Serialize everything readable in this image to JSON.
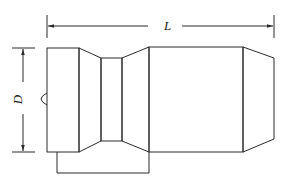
{
  "diagram": {
    "title": "",
    "type": "technical drawing - nozzle/fitting side view",
    "labels": {
      "length": "L",
      "diameter": "D"
    },
    "colors": {
      "stroke": "#2a2a2a",
      "background": "#ffffff"
    },
    "components": [
      {
        "name": "left-cylinder-block",
        "x": [
          47,
          79
        ],
        "y": [
          47,
          152
        ]
      },
      {
        "name": "left-taper",
        "x": [
          79,
          101
        ]
      },
      {
        "name": "neck",
        "x": [
          101,
          122
        ],
        "y": [
          58,
          141
        ]
      },
      {
        "name": "right-taper",
        "x": [
          122,
          149
        ]
      },
      {
        "name": "main-body",
        "x": [
          149,
          243
        ],
        "y": [
          46,
          152
        ]
      },
      {
        "name": "nose-cone",
        "x": [
          243,
          274
        ],
        "y": [
          58,
          139
        ]
      },
      {
        "name": "bottom-bracket",
        "x": [
          57,
          149
        ],
        "y": [
          152,
          173
        ]
      },
      {
        "name": "side-bump",
        "x": 47,
        "y": 99
      }
    ],
    "dimensions": [
      {
        "label": "L",
        "from_x": 47,
        "to_x": 274,
        "y": 26
      },
      {
        "label": "D",
        "from_y": 47,
        "to_y": 152,
        "x": 23
      }
    ]
  }
}
